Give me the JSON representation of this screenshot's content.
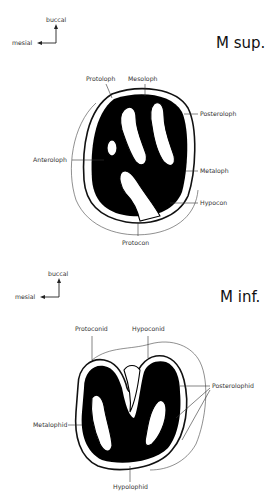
{
  "panels": [
    {
      "id": "upper",
      "title": "M sup.",
      "orientation": {
        "vertical": "buccal",
        "horizontal": "mesial"
      },
      "labels": [
        "Protoloph",
        "Mesoloph",
        "Posteroloph",
        "Anteroloph",
        "Metaloph",
        "Hypocon",
        "Protocon"
      ]
    },
    {
      "id": "lower",
      "title": "M inf.",
      "orientation": {
        "vertical": "buccal",
        "horizontal": "mesial"
      },
      "labels": [
        "Protoconid",
        "Hypoconid",
        "Posterolophid",
        "Metalophid",
        "Hypolophid"
      ]
    }
  ]
}
